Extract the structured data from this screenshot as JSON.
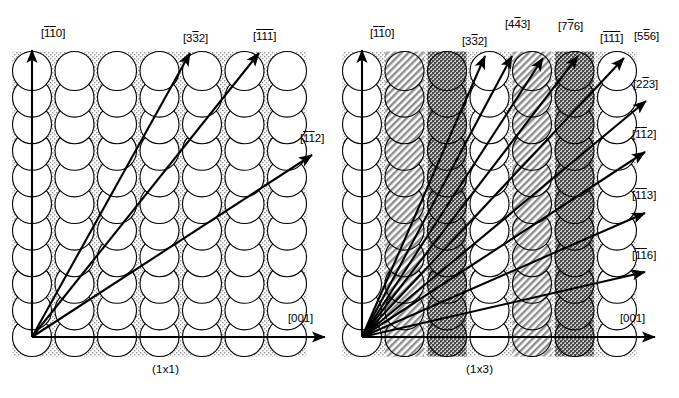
{
  "figure": {
    "background_color": "#ffffff",
    "line_color": "#000000",
    "width": 679,
    "height": 398
  },
  "panels": [
    {
      "id": "panel-1x1",
      "caption": "(1x1)",
      "caption_x": 152,
      "caption_y": 363,
      "origin": {
        "x": 32,
        "y": 337
      },
      "lattice": {
        "type": "square",
        "columns": 7,
        "rows": 11,
        "spacing_x": 42.5,
        "spacing_y": 26.6,
        "circle_radius": 19.5,
        "circle_fill": "#ffffff",
        "circle_stroke": "#000000",
        "background_fill": "#e9e9e9",
        "interstice_fill": "#d8d8d8"
      },
      "axes": [
        {
          "name": "vertical-axis",
          "label_plain": "[110]",
          "bars": [
            1,
            1,
            0
          ]
        },
        {
          "name": "horizontal-axis",
          "label_plain": "[001]",
          "bars": [
            0,
            0,
            0
          ]
        }
      ],
      "vectors": [
        {
          "name": "direction-vector-110",
          "label": "[110]",
          "digits": [
            "1",
            "1",
            "0"
          ],
          "overbars": [
            true,
            true,
            false
          ],
          "tip_x": 32,
          "tip_y": 50,
          "label_x": 41,
          "label_y": 28
        },
        {
          "name": "direction-vector-332",
          "label": "[332]",
          "digits": [
            "3",
            "3",
            "2"
          ],
          "overbars": [
            false,
            true,
            false
          ],
          "tip_x": 190,
          "tip_y": 53,
          "label_x": 183,
          "label_y": 33
        },
        {
          "name": "direction-vector-111",
          "label": "[111]",
          "digits": [
            "1",
            "1",
            "1"
          ],
          "overbars": [
            true,
            true,
            true
          ],
          "tip_x": 259,
          "tip_y": 53,
          "label_x": 253,
          "label_y": 31
        },
        {
          "name": "direction-vector-112",
          "label": "[112]",
          "digits": [
            "1",
            "1",
            "2"
          ],
          "overbars": [
            true,
            true,
            false
          ],
          "tip_x": 312,
          "tip_y": 155,
          "label_x": 300,
          "label_y": 133
        },
        {
          "name": "direction-vector-001",
          "label": "[001]",
          "digits": [
            "0",
            "0",
            "1"
          ],
          "overbars": [
            false,
            false,
            false
          ],
          "tip_x": 325,
          "tip_y": 337,
          "label_x": 288,
          "label_y": 313
        }
      ]
    },
    {
      "id": "panel-1x3",
      "caption": "(1x3)",
      "caption_x": 466,
      "caption_y": 363,
      "origin": {
        "x": 362,
        "y": 337
      },
      "lattice": {
        "type": "square-reconstructed",
        "columns": 7,
        "rows": 11,
        "spacing_x": 42.5,
        "spacing_y": 26.6,
        "circle_radius": 19.5,
        "periodicity": 3,
        "column_styles": [
          "plain",
          "hatched",
          "dark",
          "plain",
          "hatched",
          "dark",
          "plain"
        ],
        "circle_fill": "#ffffff",
        "circle_stroke": "#000000",
        "hatch_fill": "#bfbfbf",
        "dark_fill": "#8a8a8a",
        "background_fill": "#e9e9e9"
      },
      "axes": [
        {
          "name": "vertical-axis",
          "label_plain": "[110]",
          "bars": [
            1,
            1,
            0
          ]
        },
        {
          "name": "horizontal-axis",
          "label_plain": "[001]",
          "bars": [
            0,
            0,
            0
          ]
        }
      ],
      "vectors": [
        {
          "name": "direction-vector-110",
          "label": "[110]",
          "digits": [
            "1",
            "1",
            "0"
          ],
          "overbars": [
            true,
            true,
            false
          ],
          "tip_x": 362,
          "tip_y": 50,
          "label_x": 370,
          "label_y": 28
        },
        {
          "name": "direction-vector-332",
          "label": "[332]",
          "digits": [
            "3",
            "3",
            "2"
          ],
          "overbars": [
            false,
            true,
            false
          ],
          "tip_x": 485,
          "tip_y": 56,
          "label_x": 462,
          "label_y": 36
        },
        {
          "name": "direction-vector-443",
          "label": "[443]",
          "digits": [
            "4",
            "4",
            "3"
          ],
          "overbars": [
            false,
            true,
            false
          ],
          "tip_x": 512,
          "tip_y": 56,
          "label_x": 505,
          "label_y": 19
        },
        {
          "name": "direction-vector-776",
          "label": "[776]",
          "digits": [
            "7",
            "7",
            "6"
          ],
          "overbars": [
            false,
            true,
            false
          ],
          "tip_x": 543,
          "tip_y": 58,
          "label_x": 558,
          "label_y": 21
        },
        {
          "name": "direction-vector-111",
          "label": "[111]",
          "digits": [
            "1",
            "1",
            "1"
          ],
          "overbars": [
            true,
            true,
            true
          ],
          "tip_x": 578,
          "tip_y": 56,
          "label_x": 600,
          "label_y": 33
        },
        {
          "name": "direction-vector-556",
          "label": "[556]",
          "digits": [
            "5",
            "5",
            "6"
          ],
          "overbars": [
            false,
            true,
            false
          ],
          "tip_x": 624,
          "tip_y": 58,
          "label_x": 634,
          "label_y": 31
        },
        {
          "name": "direction-vector-223",
          "label": "[223]",
          "digits": [
            "2",
            "2",
            "3"
          ],
          "overbars": [
            false,
            true,
            false
          ],
          "tip_x": 646,
          "tip_y": 101,
          "label_x": 633,
          "label_y": 79
        },
        {
          "name": "direction-vector-112",
          "label": "[112]",
          "digits": [
            "1",
            "1",
            "2"
          ],
          "overbars": [
            true,
            true,
            false
          ],
          "tip_x": 645,
          "tip_y": 152,
          "label_x": 632,
          "label_y": 129
        },
        {
          "name": "direction-vector-113",
          "label": "[113]",
          "digits": [
            "1",
            "1",
            "3"
          ],
          "overbars": [
            true,
            true,
            false
          ],
          "tip_x": 645,
          "tip_y": 213,
          "label_x": 632,
          "label_y": 190
        },
        {
          "name": "direction-vector-116",
          "label": "[116]",
          "digits": [
            "1",
            "1",
            "6"
          ],
          "overbars": [
            true,
            true,
            false
          ],
          "tip_x": 645,
          "tip_y": 272,
          "label_x": 632,
          "label_y": 250
        },
        {
          "name": "direction-vector-001",
          "label": "[001]",
          "digits": [
            "0",
            "0",
            "1"
          ],
          "overbars": [
            false,
            false,
            false
          ],
          "tip_x": 655,
          "tip_y": 337,
          "label_x": 620,
          "label_y": 313
        }
      ]
    }
  ]
}
